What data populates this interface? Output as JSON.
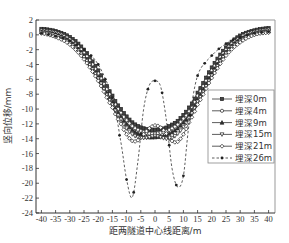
{
  "chart_data": {
    "type": "line",
    "title": "",
    "xlabel": "距两隧道中心线距离/m",
    "ylabel": "竖向位移/mm",
    "xlim": [
      -42,
      42
    ],
    "ylim": [
      -24,
      2
    ],
    "xticks": [
      -40,
      -35,
      -30,
      -25,
      -20,
      -15,
      -10,
      -5,
      0,
      5,
      10,
      15,
      20,
      25,
      30,
      35,
      40
    ],
    "yticks": [
      2,
      0,
      -2,
      -4,
      -6,
      -8,
      -10,
      -12,
      -14,
      -16,
      -18,
      -20,
      -22,
      -24
    ],
    "grid": false,
    "legend_position": "right-center",
    "x": [
      -40,
      -35,
      -30,
      -25,
      -20,
      -15,
      -12,
      -10,
      -8,
      -6,
      -4,
      -2,
      0,
      2,
      4,
      6,
      8,
      10,
      12,
      15,
      20,
      25,
      30,
      35,
      40
    ],
    "series": [
      {
        "name": "埋深0m",
        "marker": "square",
        "dash": "solid",
        "values": [
          0.8,
          0.5,
          -0.3,
          -2.0,
          -4.8,
          -8.2,
          -10.0,
          -11.0,
          -11.8,
          -12.3,
          -12.6,
          -12.8,
          -12.8,
          -12.7,
          -12.5,
          -12.1,
          -11.6,
          -10.8,
          -9.8,
          -7.8,
          -4.4,
          -1.7,
          -0.1,
          0.6,
          0.9
        ]
      },
      {
        "name": "埋深4m",
        "marker": "circle",
        "dash": "solid",
        "values": [
          0.6,
          0.3,
          -0.6,
          -2.4,
          -5.2,
          -8.6,
          -10.5,
          -11.5,
          -12.3,
          -12.8,
          -13.1,
          -13.3,
          -13.3,
          -13.2,
          -13.0,
          -12.6,
          -12.1,
          -11.3,
          -10.3,
          -8.2,
          -4.8,
          -2.0,
          -0.3,
          0.4,
          0.7
        ]
      },
      {
        "name": "埋深9m",
        "marker": "triangle-up",
        "dash": "solid",
        "values": [
          0.4,
          0.1,
          -0.9,
          -2.8,
          -5.7,
          -9.1,
          -11.0,
          -12.0,
          -12.8,
          -13.3,
          -13.6,
          -13.8,
          -13.8,
          -13.7,
          -13.5,
          -13.1,
          -12.6,
          -11.8,
          -10.8,
          -8.7,
          -5.2,
          -2.3,
          -0.6,
          0.2,
          0.5
        ]
      },
      {
        "name": "埋深15m",
        "marker": "triangle-down",
        "dash": "solid",
        "values": [
          0.3,
          -0.1,
          -1.1,
          -3.0,
          -5.9,
          -9.4,
          -11.4,
          -12.6,
          -13.4,
          -13.8,
          -13.9,
          -13.8,
          -13.6,
          -13.8,
          -14.0,
          -13.9,
          -13.3,
          -12.4,
          -11.2,
          -9.0,
          -5.5,
          -2.5,
          -0.8,
          0.1,
          0.4
        ]
      },
      {
        "name": "埋深21m",
        "marker": "diamond",
        "dash": "solid",
        "values": [
          0.2,
          -0.3,
          -1.3,
          -3.3,
          -6.2,
          -9.8,
          -12.0,
          -13.4,
          -14.3,
          -14.2,
          -13.4,
          -12.6,
          -12.2,
          -12.5,
          -13.3,
          -14.3,
          -14.4,
          -13.4,
          -11.8,
          -9.4,
          -5.8,
          -2.8,
          -1.0,
          0.0,
          0.3
        ]
      },
      {
        "name": "埋深26m",
        "marker": "star",
        "dash": "dashed",
        "values": [
          0.2,
          -0.2,
          -0.8,
          -2.0,
          -4.0,
          -8.5,
          -14.5,
          -19.5,
          -21.9,
          -17.0,
          -10.0,
          -6.8,
          -6.2,
          -7.0,
          -11.5,
          -18.0,
          -20.5,
          -19.0,
          -12.0,
          -5.5,
          -2.8,
          -1.2,
          -0.3,
          0.2,
          0.4
        ]
      }
    ]
  },
  "legend": {
    "items": [
      "埋深0m",
      "埋深4m",
      "埋深9m",
      "埋深15m",
      "埋深21m",
      "埋深26m"
    ]
  }
}
